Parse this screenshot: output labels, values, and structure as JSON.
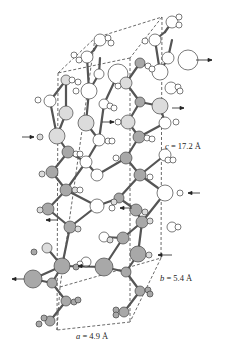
{
  "diagram": {
    "type": "crystal-structure-unit-cell",
    "labels": {
      "c": {
        "var": "c",
        "text": " = 17.2 Å"
      },
      "b": {
        "var": "b",
        "text": " = 5.4 Å"
      },
      "a": {
        "var": "a",
        "text": " = 4.9 Å"
      }
    },
    "colors": {
      "bond": "#555555",
      "atom_white": "#ffffff",
      "atom_light": "#dcdcdc",
      "atom_gray": "#a8a8a8",
      "outline": "#444444",
      "cell_edge": "#444444"
    },
    "cell": {
      "top_back_left": [
        95,
        38
      ],
      "top_back_right": [
        162,
        17
      ],
      "top_front_left": [
        58,
        73
      ],
      "top_front_right": [
        130,
        58
      ],
      "bottom_back_left": [
        60,
        287
      ],
      "bottom_back_right": [
        161,
        258
      ],
      "bottom_front_left": [
        57,
        330
      ],
      "bottom_front_right": [
        130,
        322
      ]
    },
    "arrows": [
      {
        "x1": 196,
        "y1": 60,
        "x2": 212,
        "y2": 60
      },
      {
        "x1": 172,
        "y1": 108,
        "x2": 184,
        "y2": 108
      },
      {
        "x1": 102,
        "y1": 122,
        "x2": 114,
        "y2": 122
      },
      {
        "x1": 22,
        "y1": 137,
        "x2": 34,
        "y2": 137
      },
      {
        "x1": 200,
        "y1": 193,
        "x2": 188,
        "y2": 193
      },
      {
        "x1": 132,
        "y1": 208,
        "x2": 120,
        "y2": 208
      },
      {
        "x1": 58,
        "y1": 220,
        "x2": 46,
        "y2": 220
      },
      {
        "x1": 172,
        "y1": 255,
        "x2": 158,
        "y2": 255
      },
      {
        "x1": 90,
        "y1": 266,
        "x2": 78,
        "y2": 266
      },
      {
        "x1": 24,
        "y1": 279,
        "x2": 12,
        "y2": 279
      }
    ],
    "atoms": [
      {
        "x": 172,
        "y": 22,
        "r": 6,
        "c": "w"
      },
      {
        "x": 179,
        "y": 17,
        "r": 3,
        "c": "w"
      },
      {
        "x": 179,
        "y": 25,
        "r": 3,
        "c": "w"
      },
      {
        "x": 100,
        "y": 40,
        "r": 6,
        "c": "w"
      },
      {
        "x": 108,
        "y": 38,
        "r": 3,
        "c": "w"
      },
      {
        "x": 111,
        "y": 43,
        "r": 3,
        "c": "w"
      },
      {
        "x": 155,
        "y": 40,
        "r": 6,
        "c": "w"
      },
      {
        "x": 145,
        "y": 41,
        "r": 3,
        "c": "w"
      },
      {
        "x": 87,
        "y": 57,
        "r": 6,
        "c": "w"
      },
      {
        "x": 74,
        "y": 55,
        "r": 3,
        "c": "w"
      },
      {
        "x": 79,
        "y": 60,
        "r": 3,
        "c": "w"
      },
      {
        "x": 168,
        "y": 58,
        "r": 6,
        "c": "w"
      },
      {
        "x": 188,
        "y": 60,
        "r": 10,
        "c": "w"
      },
      {
        "x": 140,
        "y": 63,
        "r": 5,
        "c": "g"
      },
      {
        "x": 148,
        "y": 66,
        "r": 3,
        "c": "w"
      },
      {
        "x": 152,
        "y": 69,
        "r": 3,
        "c": "w"
      },
      {
        "x": 118,
        "y": 74,
        "r": 10,
        "c": "w"
      },
      {
        "x": 99,
        "y": 74,
        "r": 5,
        "c": "w"
      },
      {
        "x": 160,
        "y": 72,
        "r": 8,
        "c": "w"
      },
      {
        "x": 66,
        "y": 80,
        "r": 5,
        "c": "l"
      },
      {
        "x": 72,
        "y": 80,
        "r": 3,
        "c": "w"
      },
      {
        "x": 78,
        "y": 82,
        "r": 3,
        "c": "w"
      },
      {
        "x": 126,
        "y": 83,
        "r": 6,
        "c": "l"
      },
      {
        "x": 118,
        "y": 86,
        "r": 3,
        "c": "w"
      },
      {
        "x": 89,
        "y": 91,
        "r": 8,
        "c": "w"
      },
      {
        "x": 76,
        "y": 91,
        "r": 3,
        "c": "w"
      },
      {
        "x": 171,
        "y": 88,
        "r": 6,
        "c": "w"
      },
      {
        "x": 178,
        "y": 87,
        "r": 3,
        "c": "w"
      },
      {
        "x": 180,
        "y": 91,
        "r": 3,
        "c": "w"
      },
      {
        "x": 50,
        "y": 101,
        "r": 6,
        "c": "w"
      },
      {
        "x": 38,
        "y": 100,
        "r": 3,
        "c": "w"
      },
      {
        "x": 104,
        "y": 104,
        "r": 5,
        "c": "w"
      },
      {
        "x": 110,
        "y": 106,
        "r": 3,
        "c": "w"
      },
      {
        "x": 114,
        "y": 108,
        "r": 3,
        "c": "w"
      },
      {
        "x": 140,
        "y": 102,
        "r": 5,
        "c": "g"
      },
      {
        "x": 160,
        "y": 106,
        "r": 8,
        "c": "l"
      },
      {
        "x": 66,
        "y": 113,
        "r": 7,
        "c": "l"
      },
      {
        "x": 86,
        "y": 123,
        "r": 8,
        "c": "l"
      },
      {
        "x": 128,
        "y": 122,
        "r": 7,
        "c": "l"
      },
      {
        "x": 118,
        "y": 122,
        "r": 3,
        "c": "w"
      },
      {
        "x": 165,
        "y": 123,
        "r": 6,
        "c": "w"
      },
      {
        "x": 176,
        "y": 122,
        "r": 3,
        "c": "w"
      },
      {
        "x": 57,
        "y": 136,
        "r": 8,
        "c": "l"
      },
      {
        "x": 40,
        "y": 137,
        "r": 3,
        "c": "l"
      },
      {
        "x": 99,
        "y": 140,
        "r": 6,
        "c": "w"
      },
      {
        "x": 108,
        "y": 141,
        "r": 3,
        "c": "w"
      },
      {
        "x": 112,
        "y": 141,
        "r": 3,
        "c": "w"
      },
      {
        "x": 139,
        "y": 137,
        "r": 6,
        "c": "g"
      },
      {
        "x": 147,
        "y": 138,
        "r": 3,
        "c": "w"
      },
      {
        "x": 152,
        "y": 139,
        "r": 3,
        "c": "w"
      },
      {
        "x": 68,
        "y": 152,
        "r": 6,
        "c": "g"
      },
      {
        "x": 76,
        "y": 154,
        "r": 3,
        "c": "w"
      },
      {
        "x": 80,
        "y": 154,
        "r": 3,
        "c": "w"
      },
      {
        "x": 86,
        "y": 162,
        "r": 6,
        "c": "w"
      },
      {
        "x": 126,
        "y": 158,
        "r": 6,
        "c": "g"
      },
      {
        "x": 116,
        "y": 158,
        "r": 3,
        "c": "w"
      },
      {
        "x": 165,
        "y": 155,
        "r": 6,
        "c": "w"
      },
      {
        "x": 168,
        "y": 160,
        "r": 3,
        "c": "w"
      },
      {
        "x": 173,
        "y": 160,
        "r": 3,
        "c": "w"
      },
      {
        "x": 52,
        "y": 172,
        "r": 6,
        "c": "g"
      },
      {
        "x": 42,
        "y": 174,
        "r": 3,
        "c": "l"
      },
      {
        "x": 97,
        "y": 175,
        "r": 6,
        "c": "w"
      },
      {
        "x": 140,
        "y": 175,
        "r": 6,
        "c": "g"
      },
      {
        "x": 150,
        "y": 177,
        "r": 3,
        "c": "w"
      },
      {
        "x": 66,
        "y": 190,
        "r": 6,
        "c": "g"
      },
      {
        "x": 75,
        "y": 190,
        "r": 3,
        "c": "l"
      },
      {
        "x": 80,
        "y": 190,
        "r": 3,
        "c": "w"
      },
      {
        "x": 165,
        "y": 193,
        "r": 8,
        "c": "w"
      },
      {
        "x": 180,
        "y": 193,
        "r": 3,
        "c": "w"
      },
      {
        "x": 119,
        "y": 198,
        "r": 5,
        "c": "g"
      },
      {
        "x": 114,
        "y": 202,
        "r": 3,
        "c": "l"
      },
      {
        "x": 97,
        "y": 206,
        "r": 7,
        "c": "w"
      },
      {
        "x": 112,
        "y": 208,
        "r": 3,
        "c": "w"
      },
      {
        "x": 136,
        "y": 210,
        "r": 6,
        "c": "g"
      },
      {
        "x": 145,
        "y": 212,
        "r": 3,
        "c": "l"
      },
      {
        "x": 48,
        "y": 209,
        "r": 6,
        "c": "g"
      },
      {
        "x": 40,
        "y": 210,
        "r": 3,
        "c": "l"
      },
      {
        "x": 70,
        "y": 227,
        "r": 6,
        "c": "g"
      },
      {
        "x": 78,
        "y": 229,
        "r": 3,
        "c": "l"
      },
      {
        "x": 142,
        "y": 222,
        "r": 6,
        "c": "g"
      },
      {
        "x": 150,
        "y": 221,
        "r": 3,
        "c": "l"
      },
      {
        "x": 172,
        "y": 227,
        "r": 5,
        "c": "w"
      },
      {
        "x": 178,
        "y": 227,
        "r": 3,
        "c": "w"
      },
      {
        "x": 104,
        "y": 237,
        "r": 5,
        "c": "w"
      },
      {
        "x": 110,
        "y": 240,
        "r": 3,
        "c": "l"
      },
      {
        "x": 123,
        "y": 238,
        "r": 6,
        "c": "g"
      },
      {
        "x": 47,
        "y": 248,
        "r": 5,
        "c": "l"
      },
      {
        "x": 34,
        "y": 252,
        "r": 3,
        "c": "g"
      },
      {
        "x": 138,
        "y": 254,
        "r": 8,
        "c": "g"
      },
      {
        "x": 149,
        "y": 255,
        "r": 3,
        "c": "l"
      },
      {
        "x": 86,
        "y": 262,
        "r": 5,
        "c": "w"
      },
      {
        "x": 80,
        "y": 264,
        "r": 3,
        "c": "w"
      },
      {
        "x": 62,
        "y": 266,
        "r": 8,
        "c": "g"
      },
      {
        "x": 76,
        "y": 267,
        "r": 3,
        "c": "g"
      },
      {
        "x": 104,
        "y": 267,
        "r": 9,
        "c": "g"
      },
      {
        "x": 126,
        "y": 272,
        "r": 5,
        "c": "g"
      },
      {
        "x": 33,
        "y": 279,
        "r": 9,
        "c": "g"
      },
      {
        "x": 52,
        "y": 283,
        "r": 5,
        "c": "g"
      },
      {
        "x": 140,
        "y": 291,
        "r": 5,
        "c": "g"
      },
      {
        "x": 148,
        "y": 290,
        "r": 3,
        "c": "g"
      },
      {
        "x": 150,
        "y": 294,
        "r": 3,
        "c": "g"
      },
      {
        "x": 66,
        "y": 301,
        "r": 5,
        "c": "g"
      },
      {
        "x": 74,
        "y": 302,
        "r": 3,
        "c": "g"
      },
      {
        "x": 78,
        "y": 300,
        "r": 3,
        "c": "g"
      },
      {
        "x": 124,
        "y": 312,
        "r": 5,
        "c": "g"
      },
      {
        "x": 116,
        "y": 310,
        "r": 3,
        "c": "g"
      },
      {
        "x": 116,
        "y": 315,
        "r": 3,
        "c": "g"
      },
      {
        "x": 50,
        "y": 321,
        "r": 5,
        "c": "g"
      },
      {
        "x": 44,
        "y": 318,
        "r": 3,
        "c": "g"
      },
      {
        "x": 39,
        "y": 324,
        "r": 3,
        "c": "g"
      }
    ],
    "bonds": [
      [
        172,
        22,
        165,
        32
      ],
      [
        165,
        32,
        155,
        40
      ],
      [
        155,
        40,
        160,
        72
      ],
      [
        160,
        72,
        168,
        58
      ],
      [
        168,
        58,
        172,
        40
      ],
      [
        100,
        40,
        94,
        50
      ],
      [
        94,
        50,
        87,
        57
      ],
      [
        87,
        57,
        89,
        91
      ],
      [
        89,
        91,
        99,
        74
      ],
      [
        99,
        74,
        100,
        58
      ],
      [
        66,
        80,
        50,
        101
      ],
      [
        50,
        101,
        57,
        136
      ],
      [
        57,
        136,
        66,
        113
      ],
      [
        66,
        113,
        66,
        80
      ],
      [
        89,
        91,
        86,
        123
      ],
      [
        86,
        123,
        99,
        140
      ],
      [
        99,
        140,
        104,
        104
      ],
      [
        104,
        104,
        118,
        74
      ],
      [
        126,
        83,
        140,
        63
      ],
      [
        140,
        63,
        160,
        72
      ],
      [
        126,
        83,
        140,
        102
      ],
      [
        140,
        102,
        160,
        106
      ],
      [
        160,
        106,
        165,
        123
      ],
      [
        128,
        122,
        140,
        102
      ],
      [
        128,
        122,
        139,
        137
      ],
      [
        139,
        137,
        165,
        123
      ],
      [
        139,
        137,
        126,
        158
      ],
      [
        57,
        136,
        68,
        152
      ],
      [
        68,
        152,
        86,
        162
      ],
      [
        86,
        162,
        99,
        140
      ],
      [
        68,
        152,
        52,
        172
      ],
      [
        52,
        172,
        66,
        190
      ],
      [
        66,
        190,
        86,
        162
      ],
      [
        86,
        162,
        97,
        175
      ],
      [
        97,
        175,
        126,
        158
      ],
      [
        126,
        158,
        140,
        175
      ],
      [
        140,
        175,
        165,
        155
      ],
      [
        140,
        175,
        165,
        193
      ],
      [
        140,
        175,
        119,
        198
      ],
      [
        119,
        198,
        97,
        206
      ],
      [
        97,
        206,
        66,
        190
      ],
      [
        119,
        198,
        136,
        210
      ],
      [
        136,
        210,
        142,
        222
      ],
      [
        142,
        222,
        165,
        193
      ],
      [
        66,
        190,
        48,
        209
      ],
      [
        48,
        209,
        70,
        227
      ],
      [
        70,
        227,
        97,
        206
      ],
      [
        70,
        227,
        62,
        266
      ],
      [
        62,
        266,
        47,
        248
      ],
      [
        62,
        266,
        104,
        267
      ],
      [
        104,
        267,
        123,
        238
      ],
      [
        123,
        238,
        142,
        222
      ],
      [
        123,
        238,
        104,
        237
      ],
      [
        104,
        267,
        126,
        272
      ],
      [
        126,
        272,
        138,
        254
      ],
      [
        138,
        254,
        142,
        222
      ],
      [
        126,
        272,
        140,
        291
      ],
      [
        140,
        291,
        124,
        312
      ],
      [
        62,
        266,
        52,
        283
      ],
      [
        52,
        283,
        66,
        301
      ],
      [
        66,
        301,
        50,
        321
      ],
      [
        33,
        279,
        52,
        283
      ],
      [
        62,
        266,
        33,
        279
      ]
    ]
  }
}
